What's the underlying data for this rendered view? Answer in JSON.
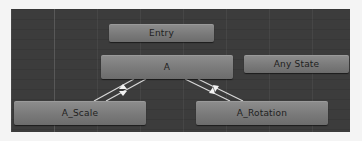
{
  "panel": {
    "title": "Animator state machine",
    "background_color": "#3c3c3c"
  },
  "states": [
    {
      "id": "entry",
      "label": "Entry"
    },
    {
      "id": "a",
      "label": "A"
    },
    {
      "id": "any_state",
      "label": "Any State"
    },
    {
      "id": "a_scale",
      "label": "A_Scale"
    },
    {
      "id": "a_rotation",
      "label": "A_Rotation"
    }
  ],
  "transitions": [
    {
      "from": "A",
      "to": "A_Scale"
    },
    {
      "from": "A_Scale",
      "to": "A"
    },
    {
      "from": "A",
      "to": "A_Rotation"
    },
    {
      "from": "A_Rotation",
      "to": "A"
    }
  ],
  "colors": {
    "node_top": "#8e8e8e",
    "node_bottom": "#6c6c6c",
    "node_text": "#1e1e1e",
    "transition_line": "#d8d8d8"
  }
}
